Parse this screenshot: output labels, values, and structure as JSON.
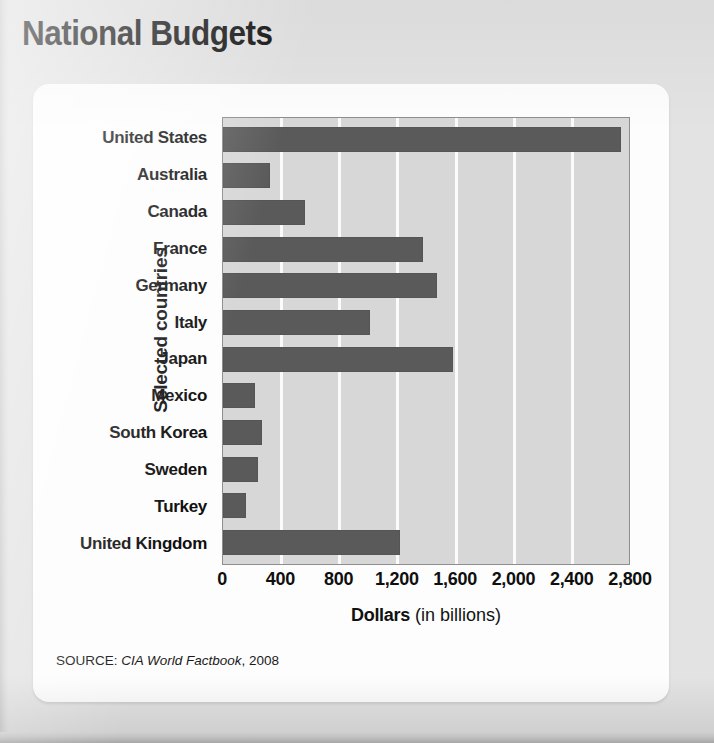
{
  "title": "National Budgets",
  "source": {
    "prefix": "SOURCE:",
    "publication": "CIA World Factbook",
    "year": ", 2008"
  },
  "axes": {
    "y_title": "Selected countries",
    "x_title_strong": "Dollars",
    "x_title_light": "(in billions)"
  },
  "colors": {
    "bar": "#5a5a5a",
    "plot_background": "#d7d7d7",
    "gridline": "#fbfbfb",
    "page_background": "#e3e3e3",
    "card_background": "#fdfdfd",
    "text": "#0f0f0f"
  },
  "chart_data": {
    "type": "bar",
    "orientation": "horizontal",
    "title": "National Budgets",
    "xlabel": "Dollars (in billions)",
    "ylabel": "Selected countries",
    "xlim": [
      0,
      2800
    ],
    "tick_labels": [
      "0",
      "400",
      "800",
      "1,200",
      "1,600",
      "2,000",
      "2,400",
      "2,800"
    ],
    "ticks": [
      0,
      400,
      800,
      1200,
      1600,
      2000,
      2400,
      2800
    ],
    "grid": true,
    "legend": "none",
    "categories": [
      "United States",
      "Australia",
      "Canada",
      "France",
      "Germany",
      "Italy",
      "Japan",
      "Mexico",
      "South Korea",
      "Sweden",
      "Turkey",
      "United Kingdom"
    ],
    "values": [
      2730,
      325,
      565,
      1370,
      1470,
      1010,
      1580,
      220,
      270,
      240,
      155,
      1215
    ]
  }
}
